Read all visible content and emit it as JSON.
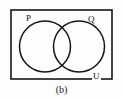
{
  "figure": {
    "caption": "(b)",
    "background_color": "#fdfdfb",
    "stroke_color": "#16161a",
    "universal_set": {
      "label": "U",
      "shape": "rectangle",
      "x": 11,
      "y": 10,
      "width": 101,
      "height": 69,
      "stroke_width": 1.6
    },
    "sets": [
      {
        "label": "P",
        "shape": "circle",
        "cx": 45,
        "cy": 46.5,
        "r": 25.5,
        "stroke_width": 1.5,
        "label_x": 26,
        "label_y": 14
      },
      {
        "label": "Q",
        "shape": "circle",
        "cx": 79,
        "cy": 46.5,
        "r": 25.5,
        "stroke_width": 1.5,
        "label_x": 88,
        "label_y": 15
      }
    ]
  }
}
